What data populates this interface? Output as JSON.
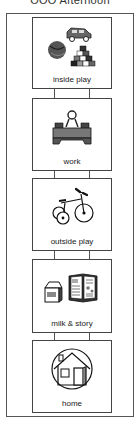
{
  "schedule": {
    "title": "ŌŌŌ Afternoon",
    "colors": {
      "border": "#444444",
      "frame": "#555555",
      "text": "#1a1a1a"
    },
    "steps": [
      {
        "label": "inside play",
        "icon": "toys-blocks-ball-icon"
      },
      {
        "label": "work",
        "icon": "desk-worker-icon"
      },
      {
        "label": "outside play",
        "icon": "tricycle-icon"
      },
      {
        "label": "milk & story",
        "icon": "milk-carton-and-book-icon"
      },
      {
        "label": "home",
        "icon": "house-icon"
      }
    ]
  }
}
